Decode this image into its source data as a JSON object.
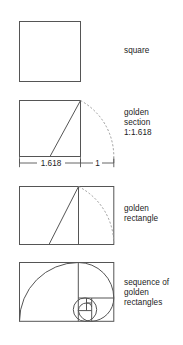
{
  "figure": {
    "background": "#ffffff",
    "stroke_color": "#555555",
    "dash_color": "#8a8a8a",
    "text_color": "#1b1b1b",
    "width": 183,
    "height": 345
  },
  "panels": [
    {
      "id": "square",
      "caption": "square",
      "shape": "square",
      "box": {
        "x": 19,
        "y": 21,
        "w": 61,
        "h": 60
      }
    },
    {
      "id": "golden-section",
      "caption": "golden\nsection\n1:1.618",
      "shape": "square-with-arc",
      "box": {
        "x": 19,
        "y": 100,
        "w": 61,
        "h": 56
      },
      "arc_end_x": 114,
      "diagonal_from": "bottom-midpoint",
      "diagonal_to": "top-right"
    },
    {
      "id": "dimension-line",
      "shape": "dimension",
      "y": 163,
      "segments": [
        {
          "label": "1.618",
          "x1": 19,
          "x2": 80
        },
        {
          "label": "1",
          "x1": 80,
          "x2": 114
        }
      ]
    },
    {
      "id": "golden-rectangle",
      "caption": "golden\nrectangle",
      "shape": "rectangle-with-arc",
      "box": {
        "x": 19,
        "y": 186,
        "w": 95,
        "h": 58
      },
      "square_width": 59
    },
    {
      "id": "golden-sequence",
      "caption": "sequence of\ngolden\nrectangles",
      "shape": "fibonacci-spiral",
      "box": {
        "x": 19,
        "y": 262,
        "w": 95,
        "h": 59
      }
    }
  ],
  "labels": {
    "dim_major": "1.618",
    "dim_minor": "1",
    "ratio": "1:1.618"
  }
}
